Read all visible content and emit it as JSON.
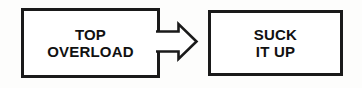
{
  "diagram": {
    "type": "flowchart",
    "orientation": "left-to-right",
    "background_color": "#fdfdfc",
    "stroke_color": "#1a1a1a",
    "text_color": "#111111",
    "nodes": [
      {
        "id": "source",
        "shape": "rectangle",
        "fill": "#ffffff",
        "lines": [
          "TOP",
          "OVERLOAD"
        ],
        "line1": "TOP",
        "line2": "OVERLOAD"
      },
      {
        "id": "target",
        "shape": "rectangle",
        "fill": "#ffffff",
        "lines": [
          "SUCK",
          "IT UP"
        ],
        "line1": "SUCK",
        "line2": "IT UP"
      }
    ],
    "connector": {
      "icon": "block-arrow-right-icon",
      "style": "hollow-outlined-block-arrow",
      "direction": "right",
      "from": "source",
      "to": "target",
      "label": ""
    }
  }
}
